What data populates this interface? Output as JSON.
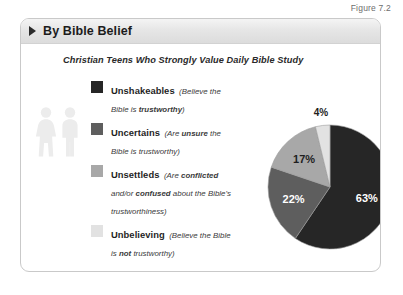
{
  "figure": {
    "caption": "Figure 7.2"
  },
  "card": {
    "header": {
      "title": "By Bible Belief",
      "marker_icon": "triangle-right-icon"
    },
    "subtitle": "Christian Teens Who Strongly Value Daily Bible Study",
    "people_icon": "two-people-icon"
  },
  "legend": {
    "items": [
      {
        "label": "Unshakeables",
        "desc_pre": "(Believe the Bible is ",
        "desc_bold": "trustworthy",
        "desc_post": ")",
        "color": "#262626"
      },
      {
        "label": "Uncertains",
        "desc_pre": "(Are ",
        "desc_bold": "unsure",
        "desc_post": " the Bible is trustworthy)",
        "color": "#5e5e5e"
      },
      {
        "label": "Unsettleds",
        "desc_pre": "(Are ",
        "desc_bold": "conflicted",
        "desc_mid": " and/or ",
        "desc_bold2": "confused",
        "desc_post": " about the Bible's trustworthiness)",
        "color": "#a8a8a8"
      },
      {
        "label": "Unbelieving",
        "desc_pre": "(Believe the Bible is ",
        "desc_bold": "not",
        "desc_post": " trustworthy)",
        "color": "#e2e2e2"
      }
    ]
  },
  "chart_data": {
    "type": "pie",
    "title": "Christian Teens Who Strongly Value Daily Bible Study",
    "categories": [
      "Unshakeables",
      "Uncertains",
      "Unsettleds",
      "Unbelieving"
    ],
    "values": [
      63,
      22,
      17,
      4
    ],
    "value_labels": [
      "63%",
      "22%",
      "17%",
      "4%"
    ],
    "colors": [
      "#262626",
      "#5e5e5e",
      "#a8a8a8",
      "#e2e2e2"
    ],
    "start_angle_deg": 0,
    "direction": "clockwise",
    "legend_position": "left",
    "label_positions": [
      "inside",
      "inside",
      "inside",
      "outside-top"
    ]
  }
}
